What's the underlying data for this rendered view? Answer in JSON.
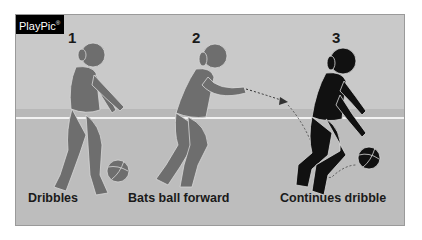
{
  "badge": {
    "label": "PlayPic",
    "mark": "®"
  },
  "steps": [
    {
      "number": "1",
      "caption": "Dribbles",
      "figure_color": "#6e6e6e"
    },
    {
      "number": "2",
      "caption": "Bats ball forward",
      "figure_color": "#6e6e6e"
    },
    {
      "number": "3",
      "caption": "Continues dribble",
      "figure_color": "#111111"
    }
  ],
  "colors": {
    "background": "#c9c9c9",
    "floor": "#bdbdbd",
    "court_line": "#f2f2f2",
    "badge_bg": "#000000"
  }
}
